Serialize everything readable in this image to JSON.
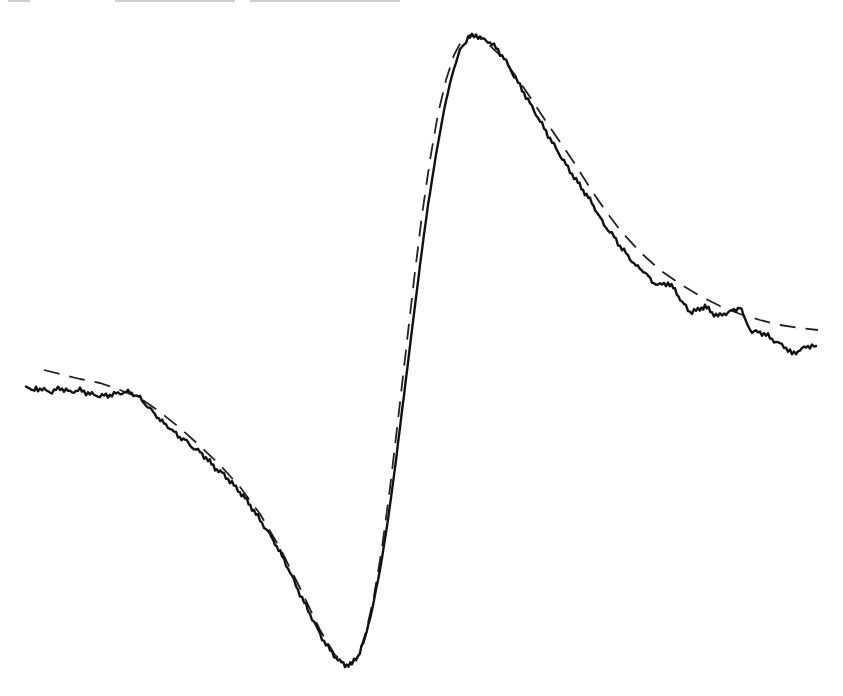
{
  "chart_data": {
    "type": "line",
    "title": "",
    "xlabel": "",
    "ylabel": "",
    "grid": false,
    "legend": null,
    "axes_visible": false,
    "note": "Derivative-shaped spectrum: noisy measured trace (solid) with fitted curve (dashed). Coordinates are pixel positions in the 843x696 image (y grows downward).",
    "series": [
      {
        "name": "measured",
        "style": "solid",
        "color": "#111111",
        "points": [
          [
            26,
            385
          ],
          [
            33,
            392
          ],
          [
            36,
            388
          ],
          [
            52,
            392
          ],
          [
            60,
            388
          ],
          [
            70,
            392
          ],
          [
            80,
            390
          ],
          [
            90,
            394
          ],
          [
            100,
            396
          ],
          [
            110,
            395
          ],
          [
            120,
            393
          ],
          [
            130,
            392
          ],
          [
            135,
            395
          ],
          [
            140,
            398
          ],
          [
            148,
            407
          ],
          [
            155,
            414
          ],
          [
            162,
            422
          ],
          [
            170,
            428
          ],
          [
            178,
            436
          ],
          [
            185,
            440
          ],
          [
            192,
            447
          ],
          [
            200,
            452
          ],
          [
            208,
            460
          ],
          [
            215,
            468
          ],
          [
            222,
            473
          ],
          [
            230,
            481
          ],
          [
            238,
            490
          ],
          [
            245,
            498
          ],
          [
            252,
            508
          ],
          [
            260,
            520
          ],
          [
            268,
            532
          ],
          [
            275,
            543
          ],
          [
            282,
            556
          ],
          [
            290,
            572
          ],
          [
            298,
            590
          ],
          [
            306,
            606
          ],
          [
            314,
            622
          ],
          [
            322,
            638
          ],
          [
            330,
            650
          ],
          [
            338,
            660
          ],
          [
            345,
            665
          ],
          [
            352,
            664
          ],
          [
            358,
            656
          ],
          [
            365,
            638
          ],
          [
            372,
            610
          ],
          [
            380,
            570
          ],
          [
            388,
            520
          ],
          [
            396,
            460
          ],
          [
            404,
            395
          ],
          [
            412,
            330
          ],
          [
            420,
            265
          ],
          [
            428,
            205
          ],
          [
            436,
            155
          ],
          [
            444,
            110
          ],
          [
            452,
            75
          ],
          [
            460,
            50
          ],
          [
            468,
            38
          ],
          [
            476,
            35
          ],
          [
            484,
            40
          ],
          [
            490,
            42
          ],
          [
            496,
            48
          ],
          [
            504,
            58
          ],
          [
            512,
            72
          ],
          [
            520,
            86
          ],
          [
            528,
            100
          ],
          [
            536,
            114
          ],
          [
            544,
            128
          ],
          [
            552,
            142
          ],
          [
            560,
            155
          ],
          [
            568,
            168
          ],
          [
            576,
            180
          ],
          [
            583,
            190
          ],
          [
            590,
            200
          ],
          [
            597,
            212
          ],
          [
            604,
            225
          ],
          [
            612,
            234
          ],
          [
            620,
            246
          ],
          [
            628,
            256
          ],
          [
            636,
            266
          ],
          [
            645,
            272
          ],
          [
            652,
            282
          ],
          [
            660,
            285
          ],
          [
            668,
            283
          ],
          [
            675,
            290
          ],
          [
            682,
            302
          ],
          [
            690,
            312
          ],
          [
            698,
            310
          ],
          [
            705,
            306
          ],
          [
            712,
            313
          ],
          [
            720,
            316
          ],
          [
            728,
            312
          ],
          [
            736,
            310
          ],
          [
            740,
            306
          ],
          [
            745,
            320
          ],
          [
            752,
            332
          ],
          [
            760,
            332
          ],
          [
            768,
            336
          ],
          [
            776,
            342
          ],
          [
            784,
            346
          ],
          [
            792,
            354
          ],
          [
            800,
            350
          ],
          [
            808,
            346
          ],
          [
            816,
            346
          ]
        ]
      },
      {
        "name": "fit",
        "style": "dashed",
        "color": "#222222",
        "points": [
          [
            44,
            370
          ],
          [
            60,
            374
          ],
          [
            80,
            379
          ],
          [
            100,
            383
          ],
          [
            120,
            390
          ],
          [
            140,
            398
          ],
          [
            160,
            412
          ],
          [
            180,
            428
          ],
          [
            200,
            446
          ],
          [
            220,
            465
          ],
          [
            240,
            487
          ],
          [
            260,
            514
          ],
          [
            280,
            548
          ],
          [
            300,
            588
          ],
          [
            320,
            630
          ],
          [
            335,
            655
          ],
          [
            348,
            666
          ],
          [
            358,
            657
          ],
          [
            366,
            632
          ],
          [
            374,
            596
          ],
          [
            382,
            548
          ],
          [
            390,
            488
          ],
          [
            398,
            420
          ],
          [
            406,
            350
          ],
          [
            414,
            280
          ],
          [
            422,
            215
          ],
          [
            430,
            160
          ],
          [
            438,
            114
          ],
          [
            446,
            80
          ],
          [
            454,
            55
          ],
          [
            462,
            40
          ],
          [
            470,
            35
          ],
          [
            478,
            37
          ],
          [
            488,
            44
          ],
          [
            500,
            55
          ],
          [
            515,
            75
          ],
          [
            530,
            97
          ],
          [
            545,
            120
          ],
          [
            560,
            142
          ],
          [
            575,
            164
          ],
          [
            590,
            188
          ],
          [
            605,
            210
          ],
          [
            620,
            230
          ],
          [
            640,
            252
          ],
          [
            660,
            270
          ],
          [
            680,
            284
          ],
          [
            700,
            296
          ],
          [
            720,
            306
          ],
          [
            740,
            314
          ],
          [
            760,
            320
          ],
          [
            780,
            325
          ],
          [
            800,
            328
          ],
          [
            818,
            330
          ]
        ]
      }
    ],
    "key_features": {
      "minimum": {
        "x": 347,
        "y": 665
      },
      "maximum": {
        "x": 475,
        "y": 35
      },
      "zero_crossing_approx": {
        "x": 400,
        "y": 430
      }
    },
    "xlim_px": [
      0,
      843
    ],
    "ylim_px": [
      0,
      696
    ]
  },
  "header_remnant": {
    "visible": true,
    "text": ""
  }
}
